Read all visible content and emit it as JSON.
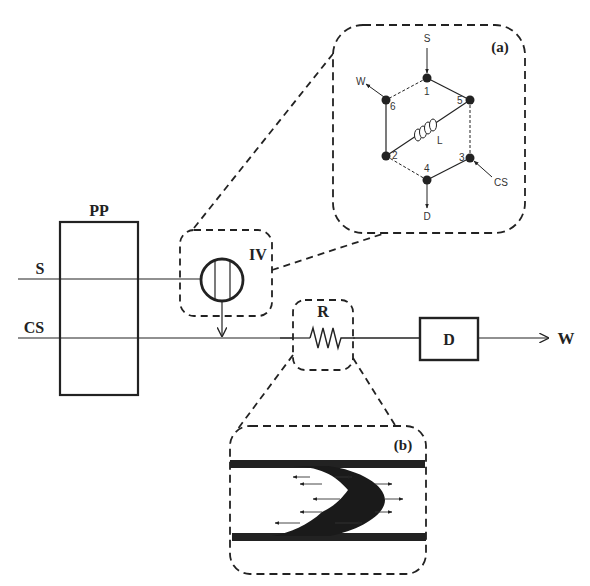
{
  "diagram": {
    "labels": {
      "pp": "PP",
      "s": "S",
      "cs": "CS",
      "iv": "IV",
      "r": "R",
      "d": "D",
      "w": "W"
    },
    "inset_a": {
      "tag": "(a)",
      "ports": {
        "s": "S",
        "w": "W",
        "d": "D",
        "cs": "CS",
        "loop": "L"
      },
      "node_numbers": [
        "1",
        "2",
        "3",
        "4",
        "5",
        "6"
      ]
    },
    "inset_b": {
      "tag": "(b)"
    },
    "colors": {
      "line": "#222222",
      "background": "#ffffff"
    }
  }
}
